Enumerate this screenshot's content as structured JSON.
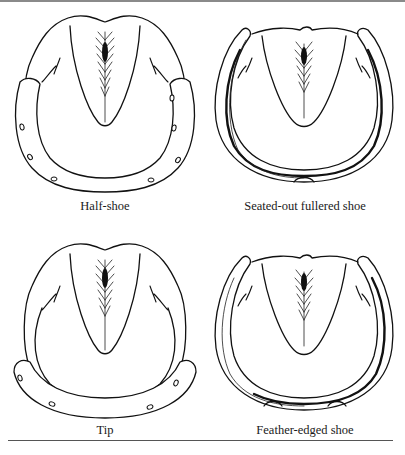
{
  "figure": {
    "panels": [
      {
        "id": "half-shoe",
        "caption": "Half-shoe"
      },
      {
        "id": "seated-out-fullered-shoe",
        "caption": "Seated-out fullered shoe"
      },
      {
        "id": "tip",
        "caption": "Tip"
      },
      {
        "id": "feather-edged-shoe",
        "caption": "Feather-edged shoe"
      }
    ]
  },
  "colors": {
    "line": "#111111",
    "background": "#ffffff",
    "rule": "#8a8a8a"
  }
}
